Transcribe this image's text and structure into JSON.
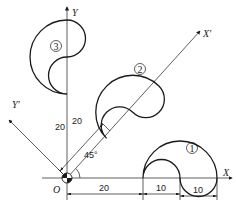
{
  "diagram": {
    "type": "coordinate-transformation",
    "origin_label": "O",
    "axes": {
      "x": "X",
      "y": "Y",
      "x_prime": "X'",
      "y_prime": "Y'"
    },
    "angle_label": "45°",
    "shapes": [
      {
        "id": "shape-1",
        "label": "①",
        "placement": "on X axis"
      },
      {
        "id": "shape-2",
        "label": "②",
        "placement": "on X' axis (rotated 45°)"
      },
      {
        "id": "shape-3",
        "label": "③",
        "placement": "on Y axis (rotated 90°)"
      }
    ],
    "dimensions": {
      "x_offset": "20",
      "inner_width": "10",
      "lobe_width": "10",
      "y_offset": "20",
      "xprime_offset": "20"
    }
  }
}
